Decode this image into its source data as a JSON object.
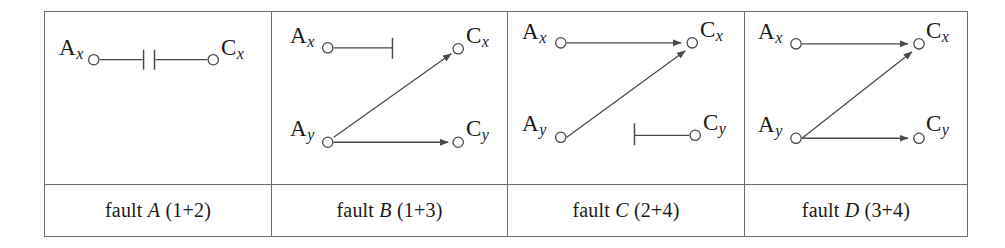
{
  "figure": {
    "kind": "fault-configuration-diagram",
    "panel_count": 4,
    "stroke_color": "#4a4a4a",
    "border_color": "#6b6b6b",
    "background": "#ffffff",
    "node_labels": {
      "ax": "A",
      "ax_sub": "x",
      "ay": "A",
      "ay_sub": "y",
      "cx": "C",
      "cx_sub": "x",
      "cy": "C",
      "cy_sub": "y"
    }
  },
  "panels": [
    {
      "id": "fault-a",
      "caption_prefix": "fault ",
      "caption_letter": "A",
      "caption_suffix": " (1+2)",
      "nodes": [
        "A_x",
        "C_x"
      ],
      "edges": [
        {
          "from": "A_x",
          "to": "C_x",
          "type": "broken-link",
          "arrow": false
        }
      ]
    },
    {
      "id": "fault-b",
      "caption_prefix": "fault ",
      "caption_letter": "B",
      "caption_suffix": " (1+3)",
      "nodes": [
        "A_x",
        "A_y",
        "C_x",
        "C_y"
      ],
      "edges": [
        {
          "from": "A_x",
          "to": "blocked",
          "type": "blocked-stub",
          "arrow": false
        },
        {
          "from": "A_y",
          "to": "C_x",
          "type": "arrow",
          "arrow": true
        },
        {
          "from": "A_y",
          "to": "C_y",
          "type": "arrow",
          "arrow": true
        }
      ]
    },
    {
      "id": "fault-c",
      "caption_prefix": "fault ",
      "caption_letter": "C",
      "caption_suffix": " (2+4)",
      "nodes": [
        "A_x",
        "A_y",
        "C_x",
        "C_y"
      ],
      "edges": [
        {
          "from": "A_x",
          "to": "C_x",
          "type": "arrow",
          "arrow": true
        },
        {
          "from": "A_y",
          "to": "C_x",
          "type": "arrow",
          "arrow": true
        },
        {
          "from": "blocked",
          "to": "C_y",
          "type": "blocked-stub-reversed",
          "arrow": false
        }
      ]
    },
    {
      "id": "fault-d",
      "caption_prefix": "fault ",
      "caption_letter": "D",
      "caption_suffix": " (3+4)",
      "nodes": [
        "A_x",
        "A_y",
        "C_x",
        "C_y"
      ],
      "edges": [
        {
          "from": "A_x",
          "to": "C_x",
          "type": "arrow",
          "arrow": true
        },
        {
          "from": "A_y",
          "to": "C_x",
          "type": "arrow",
          "arrow": true
        },
        {
          "from": "A_y",
          "to": "C_y",
          "type": "arrow",
          "arrow": true
        }
      ]
    }
  ]
}
